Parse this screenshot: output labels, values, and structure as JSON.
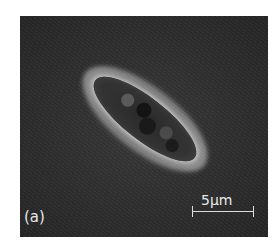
{
  "figure": {
    "panel_label": "(a)",
    "scale_bar": {
      "label": "5µm"
    }
  }
}
